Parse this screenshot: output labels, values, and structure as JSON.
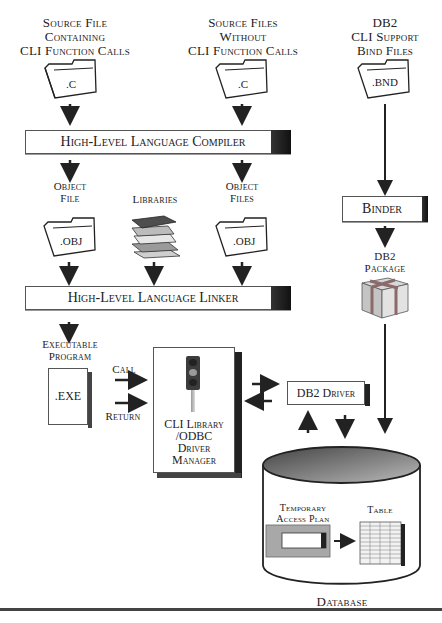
{
  "diagram": {
    "top_labels": {
      "source_with_cli": [
        "Source File",
        "Containing",
        "CLI Function Calls"
      ],
      "source_without_cli": [
        "Source Files",
        "Without",
        "CLI Function Calls"
      ],
      "bind_files": [
        "DB2",
        "CLI Support",
        "Bind Files"
      ]
    },
    "folders": {
      "source_with_cli_ext": ".C",
      "source_without_cli_ext": ".C",
      "bind_files_ext": ".BND",
      "object_file_ext": ".OBJ",
      "object_files_ext": ".OBJ"
    },
    "compiler": {
      "label": "High-Level Language Compiler"
    },
    "linker": {
      "label": "High-Level Language Linker"
    },
    "binder": {
      "label": "Binder"
    },
    "middle_labels": {
      "object_file": [
        "Object",
        "File"
      ],
      "libraries": "Libraries",
      "object_files": [
        "Object",
        "Files"
      ],
      "db2_package": [
        "DB2",
        "Package"
      ]
    },
    "executable": {
      "label": [
        "Executable",
        "Program"
      ],
      "ext": ".EXE"
    },
    "calls": {
      "call": "Call",
      "return": "Return"
    },
    "driver_manager": {
      "label": [
        "CLI Library",
        "/ODBC",
        "Driver",
        "Manager"
      ]
    },
    "db2_driver": {
      "label": "DB2 Driver"
    },
    "database": {
      "label": "Database",
      "temp_plan": [
        "Temporary",
        "Access Plan"
      ],
      "table": "Table"
    },
    "colors": {
      "ink": "#222222",
      "dark_cap": "#1a1a1a",
      "db_top": "#6a6a6a",
      "plan_fill": "#a8a8a8",
      "package_fill": "#c8c8c8",
      "package_ribbon": "#8a6a6a"
    }
  }
}
